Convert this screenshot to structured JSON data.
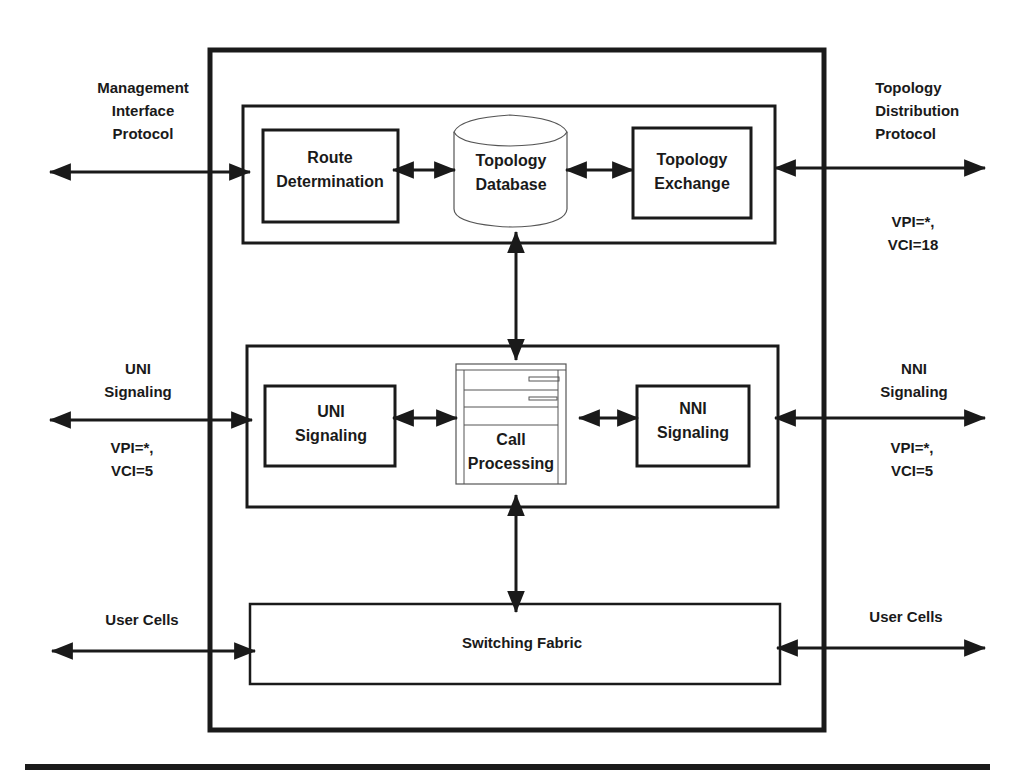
{
  "diagram": {
    "colors": {
      "stroke": "#1a1a1a",
      "background": "#ffffff",
      "light_stroke": "#555555"
    },
    "external_labels": {
      "management": [
        "Management",
        "Interface",
        "Protocol"
      ],
      "topology_distribution": [
        "Topology",
        "Distribution",
        "Protocol"
      ],
      "topology_vpi": [
        "VPI=*,",
        "VCI=18"
      ],
      "uni_external": [
        "UNI",
        "Signaling"
      ],
      "uni_vpi": [
        "VPI=*,",
        "VCI=5"
      ],
      "nni_external": [
        "NNI",
        "Signaling"
      ],
      "nni_vpi": [
        "VPI=*,",
        "VCI=5"
      ],
      "user_cells_left": "User Cells",
      "user_cells_right": "User Cells"
    },
    "components": {
      "route_determination": [
        "Route",
        "Determination"
      ],
      "topology_database": [
        "Topology",
        "Database"
      ],
      "topology_exchange": [
        "Topology",
        "Exchange"
      ],
      "uni_signaling": [
        "UNI",
        "Signaling"
      ],
      "call_processing": [
        "Call",
        "Processing"
      ],
      "nni_signaling": [
        "NNI",
        "Signaling"
      ],
      "switching_fabric": "Switching Fabric"
    },
    "icons": {
      "topology_database": "database-cylinder-icon",
      "call_processing": "server-cabinet-icon"
    }
  }
}
